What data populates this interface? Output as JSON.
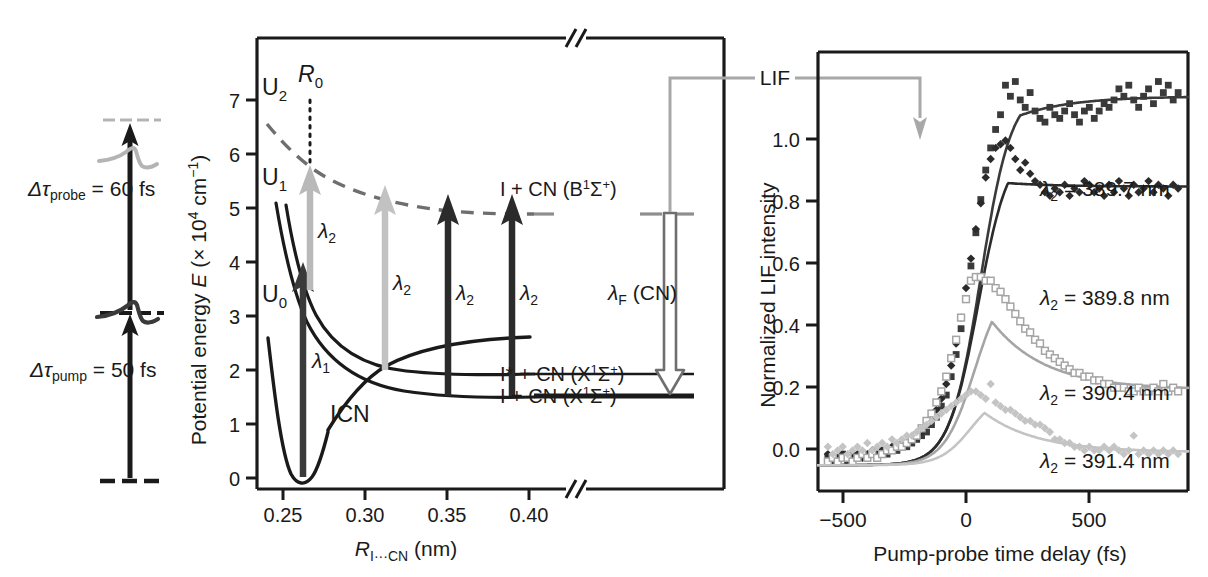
{
  "figure": {
    "panels": [
      "pulse-timing",
      "potential-energy",
      "lif-transients"
    ]
  },
  "pulse_panel": {
    "probe_label": "Δτprobe = 60 fs",
    "probe_label_main": "Δτ",
    "probe_sub": "probe",
    "probe_value": " = 60 fs",
    "pump_label_main": "Δτ",
    "pump_sub": "pump",
    "pump_value": " = 50 fs",
    "probe_color": "#b0b0b0",
    "pump_color": "#1a1a1a"
  },
  "energy_panel": {
    "ylabel_pre": "Potential energy ",
    "ylabel_italic": "E",
    "ylabel_post": " (× 10",
    "ylabel_exp": "4",
    "ylabel_unit": " cm",
    "ylabel_exp2": "−1",
    "ylabel_close": ")",
    "yticks": [
      "0",
      "1",
      "2",
      "3",
      "4",
      "5",
      "6",
      "7"
    ],
    "xticks": [
      "0.25",
      "0.30",
      "0.35",
      "0.40"
    ],
    "xlabel_italic": "R",
    "xlabel_sub": "I···CN",
    "xlabel_unit": " (nm)",
    "curve_labels": {
      "u0": "U0",
      "u0_main": "U",
      "u0_sub": "0",
      "u1_main": "U",
      "u1_sub": "1",
      "u2_main": "U",
      "u2_sub": "2",
      "r0_main": "R",
      "r0_sub": "0",
      "icn": "ICN"
    },
    "arrows": {
      "lambda1_main": "λ",
      "lambda1_sub": "1",
      "lambda2_main": "λ",
      "lambda2_sub": "2",
      "lambdaF_main": "λ",
      "lambdaF_sub": "F",
      "lambdaF_post": " (CN)"
    },
    "state_labels": [
      "I + CN (B1Σ+)",
      "I* + CN (X1Σ+)",
      "I + CN (X1Σ+)"
    ],
    "state_parts": [
      {
        "pre": "I + CN (B",
        "sup": "1",
        "mid": "Σ",
        "sup2": "+",
        "post": ")"
      },
      {
        "pre": "I* + CN (X",
        "sup": "1",
        "mid": "Σ",
        "sup2": "+",
        "post": ")"
      },
      {
        "pre": "I + CN (X",
        "sup": "1",
        "mid": "Σ",
        "sup2": "+",
        "post": ")"
      }
    ]
  },
  "connector": {
    "label": "LIF",
    "color": "#a8a8a8"
  },
  "chart_data": {
    "type": "scatter",
    "title": "",
    "xlabel": "Pump-probe time delay (fs)",
    "ylabel": "Normalized LIF intensity",
    "xlim": [
      -600,
      900
    ],
    "ylim": [
      -0.07,
      1.12
    ],
    "xticks": [
      -500,
      0,
      500
    ],
    "xticklabels": [
      "−500",
      "0",
      "500"
    ],
    "yticks": [
      0.0,
      0.2,
      0.4,
      0.6,
      0.8,
      1.0
    ],
    "yticklabels": [
      "0.0",
      "0.2",
      "0.4",
      "0.6",
      "0.8",
      "1.0"
    ],
    "grid": false,
    "legend_position": "inline-right",
    "series": [
      {
        "name": "λ2 = 389.7 nm",
        "label_main": "λ",
        "label_sub": "2",
        "label_post": " = 389.7 nm",
        "marker": "filled-square",
        "color": "#3a3a3a",
        "plateau": 1.0,
        "peak": 1.02,
        "peak_time": 220,
        "rise_center": 60,
        "points_x": [
          -560,
          -540,
          -520,
          -500,
          -480,
          -460,
          -440,
          -420,
          -400,
          -380,
          -360,
          -340,
          -320,
          -300,
          -280,
          -260,
          -240,
          -220,
          -200,
          -180,
          -160,
          -140,
          -120,
          -100,
          -80,
          -60,
          -40,
          -20,
          0,
          20,
          40,
          60,
          80,
          100,
          120,
          140,
          160,
          180,
          200,
          220,
          240,
          260,
          280,
          300,
          320,
          340,
          360,
          380,
          400,
          420,
          440,
          460,
          480,
          500,
          520,
          540,
          560,
          580,
          600,
          620,
          640,
          660,
          680,
          700,
          720,
          740,
          760,
          780,
          800,
          820,
          840,
          860
        ],
        "points_y": [
          0.02,
          0.01,
          0.02,
          0.03,
          0.01,
          0.02,
          0.02,
          0.03,
          0.02,
          0.03,
          0.02,
          0.04,
          0.03,
          0.04,
          0.04,
          0.05,
          0.05,
          0.06,
          0.07,
          0.08,
          0.09,
          0.11,
          0.13,
          0.16,
          0.19,
          0.24,
          0.3,
          0.37,
          0.45,
          0.54,
          0.63,
          0.72,
          0.8,
          0.86,
          0.91,
          0.95,
          1.03,
          1.0,
          1.04,
          0.99,
          0.97,
          1.01,
          0.96,
          0.94,
          0.93,
          0.97,
          0.95,
          0.94,
          0.96,
          0.98,
          0.95,
          0.93,
          0.96,
          0.97,
          0.94,
          0.96,
          0.98,
          0.97,
          0.99,
          1.02,
          1.0,
          1.03,
          0.99,
          0.97,
          1.0,
          1.02,
          0.98,
          1.04,
          1.01,
          1.03,
          0.99,
          1.01
        ]
      },
      {
        "name": "λ2 = 389.8 nm",
        "label_main": "λ",
        "label_sub": "2",
        "label_post": " = 389.8 nm",
        "marker": "filled-diamond",
        "color": "#2b2b2b",
        "plateau": 0.755,
        "peak": 0.875,
        "peak_time": 170,
        "rise_center": 50,
        "points_x": [
          -560,
          -540,
          -520,
          -500,
          -480,
          -460,
          -440,
          -420,
          -400,
          -380,
          -360,
          -340,
          -320,
          -300,
          -280,
          -260,
          -240,
          -220,
          -200,
          -180,
          -160,
          -140,
          -120,
          -100,
          -80,
          -60,
          -40,
          -20,
          0,
          20,
          40,
          60,
          80,
          100,
          120,
          140,
          160,
          180,
          200,
          220,
          240,
          260,
          280,
          300,
          320,
          340,
          360,
          380,
          400,
          420,
          440,
          460,
          480,
          500,
          520,
          540,
          560,
          580,
          600,
          620,
          640,
          660,
          680,
          700,
          720,
          740,
          760,
          780,
          800,
          820,
          840,
          860
        ],
        "points_y": [
          0.03,
          0.02,
          0.02,
          0.03,
          0.02,
          0.03,
          0.03,
          0.02,
          0.03,
          0.04,
          0.03,
          0.04,
          0.04,
          0.05,
          0.05,
          0.06,
          0.06,
          0.07,
          0.08,
          0.09,
          0.11,
          0.13,
          0.15,
          0.18,
          0.22,
          0.27,
          0.33,
          0.4,
          0.48,
          0.56,
          0.64,
          0.71,
          0.78,
          0.83,
          0.86,
          0.87,
          0.88,
          0.86,
          0.83,
          0.8,
          0.82,
          0.79,
          0.77,
          0.76,
          0.74,
          0.73,
          0.75,
          0.74,
          0.76,
          0.73,
          0.75,
          0.74,
          0.77,
          0.76,
          0.74,
          0.75,
          0.73,
          0.76,
          0.74,
          0.77,
          0.75,
          0.73,
          0.76,
          0.74,
          0.75,
          0.77,
          0.74,
          0.76,
          0.75,
          0.73,
          0.76,
          0.75
        ]
      },
      {
        "name": "λ2 = 390.4 nm",
        "label_main": "λ",
        "label_sub": "2",
        "label_post": " = 390.4 nm",
        "marker": "open-square",
        "color": "#a5a5a5",
        "plateau": 0.205,
        "peak": 0.515,
        "peak_time": 105,
        "rise_center": 35,
        "points_x": [
          -560,
          -540,
          -520,
          -500,
          -480,
          -460,
          -440,
          -420,
          -400,
          -380,
          -360,
          -340,
          -320,
          -300,
          -280,
          -260,
          -240,
          -220,
          -200,
          -180,
          -160,
          -140,
          -120,
          -100,
          -80,
          -60,
          -40,
          -20,
          0,
          20,
          40,
          60,
          80,
          100,
          120,
          140,
          160,
          180,
          200,
          220,
          240,
          260,
          280,
          300,
          320,
          340,
          360,
          380,
          400,
          420,
          440,
          460,
          480,
          500,
          520,
          540,
          560,
          580,
          600,
          620,
          640,
          660,
          680,
          700,
          720,
          740,
          760,
          780,
          800,
          820,
          840,
          860
        ],
        "points_y": [
          0.01,
          0.02,
          0.01,
          0.02,
          0.02,
          0.01,
          0.02,
          0.03,
          0.02,
          0.03,
          0.02,
          0.03,
          0.04,
          0.04,
          0.05,
          0.05,
          0.06,
          0.07,
          0.08,
          0.1,
          0.12,
          0.14,
          0.17,
          0.2,
          0.24,
          0.29,
          0.34,
          0.4,
          0.45,
          0.5,
          0.51,
          0.51,
          0.5,
          0.5,
          0.48,
          0.47,
          0.45,
          0.43,
          0.41,
          0.39,
          0.37,
          0.36,
          0.34,
          0.33,
          0.31,
          0.3,
          0.29,
          0.28,
          0.27,
          0.26,
          0.25,
          0.25,
          0.24,
          0.24,
          0.23,
          0.23,
          0.22,
          0.22,
          0.21,
          0.21,
          0.21,
          0.2,
          0.2,
          0.21,
          0.2,
          0.2,
          0.21,
          0.2,
          0.22,
          0.2,
          0.21,
          0.2
        ]
      },
      {
        "name": "λ2 = 391.4 nm",
        "label_main": "λ",
        "label_sub": "2",
        "label_post": " = 391.4 nm",
        "marker": "light-diamond",
        "color": "#c4c4c4",
        "plateau": 0.035,
        "peak": 0.2,
        "peak_time": 75,
        "rise_center": 20,
        "points_x": [
          -560,
          -540,
          -520,
          -500,
          -480,
          -460,
          -440,
          -420,
          -400,
          -380,
          -360,
          -340,
          -320,
          -300,
          -280,
          -260,
          -240,
          -220,
          -200,
          -180,
          -160,
          -140,
          -120,
          -100,
          -80,
          -60,
          -40,
          -20,
          0,
          20,
          40,
          60,
          80,
          100,
          120,
          140,
          160,
          180,
          200,
          220,
          240,
          260,
          280,
          300,
          320,
          340,
          360,
          380,
          400,
          420,
          440,
          460,
          480,
          500,
          520,
          540,
          560,
          580,
          600,
          620,
          640,
          660,
          680,
          700,
          720,
          740,
          760,
          780,
          800,
          820,
          840,
          860
        ],
        "points_y": [
          0.05,
          0.03,
          0.04,
          0.05,
          0.03,
          0.04,
          0.05,
          0.04,
          0.06,
          0.04,
          0.05,
          0.06,
          0.05,
          0.07,
          0.06,
          0.07,
          0.08,
          0.08,
          0.09,
          0.1,
          0.11,
          0.12,
          0.13,
          0.14,
          0.15,
          0.16,
          0.17,
          0.18,
          0.19,
          0.2,
          0.2,
          0.19,
          0.18,
          0.22,
          0.17,
          0.16,
          0.15,
          0.15,
          0.14,
          0.13,
          0.12,
          0.12,
          0.11,
          0.11,
          0.1,
          0.09,
          0.07,
          0.07,
          0.06,
          0.06,
          0.05,
          0.05,
          0.04,
          0.05,
          0.04,
          0.04,
          0.05,
          0.04,
          0.05,
          0.04,
          0.03,
          0.04,
          0.08,
          0.03,
          0.04,
          0.03,
          0.04,
          0.03,
          0.04,
          0.03,
          0.04,
          0.03
        ]
      }
    ]
  }
}
